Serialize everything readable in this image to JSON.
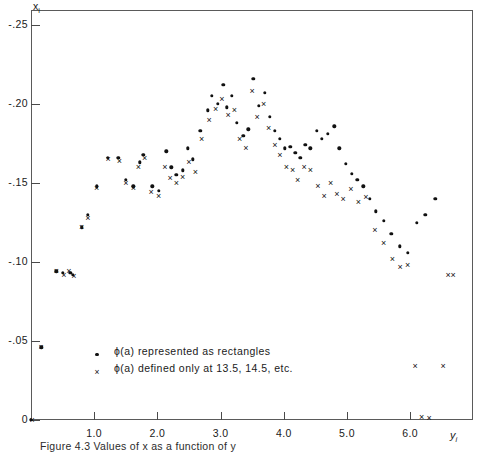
{
  "chart_data": {
    "type": "scatter",
    "title": "",
    "xlabel": "y_i",
    "ylabel": "x_i",
    "xlim": [
      0,
      6.75
    ],
    "ylim": [
      0,
      -0.26
    ],
    "y_axis_inverted": true,
    "grid": false,
    "xticks": [
      1.0,
      2.0,
      3.0,
      4.0,
      5.0,
      6.0
    ],
    "xticklabels": [
      "1.0",
      "2.0",
      "3.0",
      "4.0",
      "5.0",
      "6.0"
    ],
    "yticks": [
      -0.25,
      -0.2,
      -0.15,
      -0.1,
      -0.05,
      0
    ],
    "yticklabels": [
      "-.25",
      "-.20",
      "-.15",
      "-.10",
      "-.05",
      "0"
    ],
    "legend_position": "lower-left-inside",
    "series": [
      {
        "name": "phi-a-rectangles",
        "marker": "dot",
        "legend_label": "ϕ(a) represented as rectangles",
        "points": [
          [
            0.0,
            0.0
          ],
          [
            0.16,
            -0.046
          ],
          [
            0.4,
            -0.094
          ],
          [
            0.5,
            -0.093
          ],
          [
            0.62,
            -0.093
          ],
          [
            0.66,
            -0.092
          ],
          [
            0.8,
            -0.122
          ],
          [
            0.9,
            -0.13
          ],
          [
            1.04,
            -0.148
          ],
          [
            1.22,
            -0.166
          ],
          [
            1.38,
            -0.166
          ],
          [
            1.5,
            -0.152
          ],
          [
            1.62,
            -0.148
          ],
          [
            1.72,
            -0.163
          ],
          [
            1.78,
            -0.168
          ],
          [
            1.92,
            -0.148
          ],
          [
            2.02,
            -0.145
          ],
          [
            2.14,
            -0.17
          ],
          [
            2.22,
            -0.16
          ],
          [
            2.3,
            -0.155
          ],
          [
            2.4,
            -0.158
          ],
          [
            2.48,
            -0.172
          ],
          [
            2.56,
            -0.165
          ],
          [
            2.68,
            -0.183
          ],
          [
            2.8,
            -0.196
          ],
          [
            2.86,
            -0.205
          ],
          [
            2.96,
            -0.2
          ],
          [
            3.04,
            -0.212
          ],
          [
            3.1,
            -0.198
          ],
          [
            3.18,
            -0.205
          ],
          [
            3.26,
            -0.188
          ],
          [
            3.36,
            -0.18
          ],
          [
            3.44,
            -0.184
          ],
          [
            3.52,
            -0.216
          ],
          [
            3.6,
            -0.199
          ],
          [
            3.7,
            -0.207
          ],
          [
            3.78,
            -0.192
          ],
          [
            3.86,
            -0.183
          ],
          [
            3.94,
            -0.178
          ],
          [
            4.02,
            -0.172
          ],
          [
            4.1,
            -0.173
          ],
          [
            4.18,
            -0.169
          ],
          [
            4.26,
            -0.166
          ],
          [
            4.34,
            -0.174
          ],
          [
            4.42,
            -0.172
          ],
          [
            4.52,
            -0.183
          ],
          [
            4.6,
            -0.178
          ],
          [
            4.7,
            -0.181
          ],
          [
            4.8,
            -0.186
          ],
          [
            4.88,
            -0.172
          ],
          [
            4.98,
            -0.162
          ],
          [
            5.08,
            -0.156
          ],
          [
            5.16,
            -0.152
          ],
          [
            5.26,
            -0.148
          ],
          [
            5.36,
            -0.14
          ],
          [
            5.46,
            -0.132
          ],
          [
            5.58,
            -0.126
          ],
          [
            5.7,
            -0.118
          ],
          [
            5.84,
            -0.11
          ],
          [
            5.96,
            -0.106
          ],
          [
            6.1,
            -0.125
          ],
          [
            6.24,
            -0.13
          ],
          [
            6.4,
            -0.14
          ]
        ]
      },
      {
        "name": "phi-a-defined-at-half-integers",
        "marker": "cross",
        "legend_label": "ϕ(a) defined only at 13.5, 14.5, etc.",
        "points": [
          [
            0.02,
            0.0
          ],
          [
            0.16,
            -0.046
          ],
          [
            0.4,
            -0.094
          ],
          [
            0.52,
            -0.092
          ],
          [
            0.6,
            -0.094
          ],
          [
            0.68,
            -0.091
          ],
          [
            0.8,
            -0.122
          ],
          [
            0.9,
            -0.128
          ],
          [
            1.04,
            -0.147
          ],
          [
            1.22,
            -0.165
          ],
          [
            1.4,
            -0.164
          ],
          [
            1.5,
            -0.15
          ],
          [
            1.62,
            -0.147
          ],
          [
            1.7,
            -0.16
          ],
          [
            1.8,
            -0.166
          ],
          [
            1.9,
            -0.144
          ],
          [
            2.02,
            -0.142
          ],
          [
            2.12,
            -0.16
          ],
          [
            2.2,
            -0.153
          ],
          [
            2.3,
            -0.15
          ],
          [
            2.4,
            -0.154
          ],
          [
            2.5,
            -0.163
          ],
          [
            2.6,
            -0.157
          ],
          [
            2.7,
            -0.178
          ],
          [
            2.82,
            -0.19
          ],
          [
            2.92,
            -0.197
          ],
          [
            3.02,
            -0.203
          ],
          [
            3.12,
            -0.193
          ],
          [
            3.22,
            -0.196
          ],
          [
            3.3,
            -0.178
          ],
          [
            3.4,
            -0.172
          ],
          [
            3.5,
            -0.208
          ],
          [
            3.58,
            -0.192
          ],
          [
            3.68,
            -0.2
          ],
          [
            3.76,
            -0.185
          ],
          [
            3.86,
            -0.174
          ],
          [
            3.94,
            -0.168
          ],
          [
            4.04,
            -0.16
          ],
          [
            4.14,
            -0.158
          ],
          [
            4.22,
            -0.152
          ],
          [
            4.32,
            -0.16
          ],
          [
            4.42,
            -0.158
          ],
          [
            4.54,
            -0.148
          ],
          [
            4.64,
            -0.142
          ],
          [
            4.74,
            -0.15
          ],
          [
            4.84,
            -0.143
          ],
          [
            4.94,
            -0.14
          ],
          [
            5.06,
            -0.146
          ],
          [
            5.18,
            -0.138
          ],
          [
            5.3,
            -0.141
          ],
          [
            5.44,
            -0.12
          ],
          [
            5.58,
            -0.112
          ],
          [
            5.72,
            -0.102
          ],
          [
            5.84,
            -0.097
          ],
          [
            5.96,
            -0.098
          ],
          [
            6.08,
            -0.034
          ],
          [
            6.18,
            -0.002
          ],
          [
            6.3,
            -0.001
          ],
          [
            6.52,
            -0.034
          ],
          [
            6.6,
            -0.092
          ],
          [
            6.68,
            -0.092
          ]
        ]
      }
    ]
  },
  "axes": {
    "y_label_main": "x",
    "y_label_sub": "i",
    "x_label_main": "y",
    "x_label_sub": "i"
  },
  "legend": {
    "entries": [
      {
        "marker": "dot",
        "text": "ϕ(a) represented  as rectangles"
      },
      {
        "marker": "cross",
        "text": "ϕ(a) defined only at 13.5, 14.5, etc."
      }
    ]
  },
  "caption": {
    "text": "Figure 4.3  Values of x  as a function of y"
  }
}
